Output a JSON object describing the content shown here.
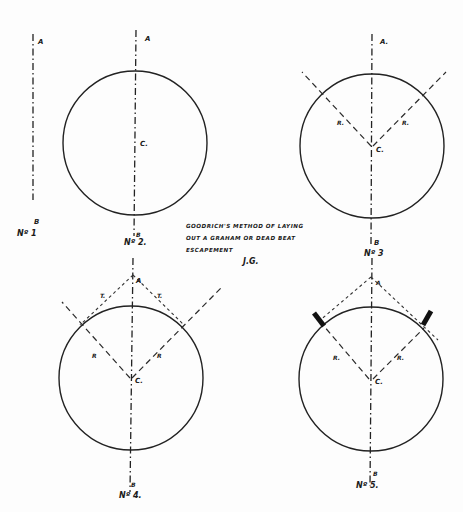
{
  "caption": {
    "line1": "GOODRICH'S METHOD OF LAYING",
    "line2": "OUT A GRAHAM OR DEAD BEAT",
    "line3": "ESCAPEMENT",
    "signature": "J.G."
  },
  "colors": {
    "ink": "#222222",
    "paper": "#fdfdfd"
  },
  "figures": [
    {
      "id": "fig1",
      "number_label": "Nº 1",
      "top_label": "A",
      "bottom_label": "B"
    },
    {
      "id": "fig2",
      "number_label": "Nº 2.",
      "top_label": "A",
      "bottom_label": "B",
      "center_label": "C."
    },
    {
      "id": "fig3",
      "number_label": "Nº 3",
      "top_label": "A.",
      "bottom_label": "B",
      "center_label": "C.",
      "ray_left_label": "R.",
      "ray_right_label": "R."
    },
    {
      "id": "fig4",
      "number_label": "Nº 4.",
      "top_label": "A",
      "bottom_label": "B",
      "center_label": "C.",
      "ray_left_label": "R",
      "ray_right_label": "R",
      "tangent_left_label": "T.",
      "tangent_right_label": "T."
    },
    {
      "id": "fig5",
      "number_label": "Nº 5.",
      "top_label": "A",
      "bottom_label": "B",
      "center_label": "C.",
      "ray_left_label": "R.",
      "ray_right_label": "R."
    }
  ]
}
